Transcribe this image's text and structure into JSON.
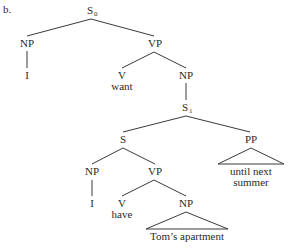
{
  "example_label": "b.",
  "tree": {
    "root": {
      "label": "S",
      "sub": "0"
    },
    "subject_np": {
      "label": "NP",
      "word": "I"
    },
    "main_vp": {
      "label": "VP"
    },
    "main_verb": {
      "label": "V",
      "word": "want"
    },
    "object_np": {
      "label": "NP"
    },
    "embedded_s1": {
      "label": "S",
      "sub": "1"
    },
    "inner_s": {
      "label": "S"
    },
    "pp": {
      "label": "PP",
      "words": [
        "until next",
        "summer"
      ]
    },
    "inner_np": {
      "label": "NP",
      "word": "I"
    },
    "inner_vp": {
      "label": "VP"
    },
    "inner_verb": {
      "label": "V",
      "word": "have"
    },
    "inner_object_np": {
      "label": "NP",
      "words": "Tom’s apartment"
    }
  }
}
